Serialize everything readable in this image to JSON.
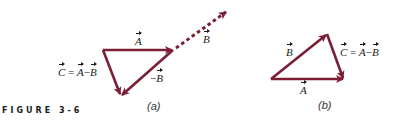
{
  "figure": {
    "label": "FIGURE 3-6"
  },
  "colors": {
    "vector": "#7a1f35",
    "text": "#1a1a1a"
  },
  "panel_a": {
    "sublabel": "(a)",
    "vector_A": {
      "name": "A",
      "from": [
        103,
        50
      ],
      "to": [
        173,
        50
      ]
    },
    "vector_negB": {
      "name": "−B",
      "from": [
        173,
        50
      ],
      "to": [
        121,
        96
      ]
    },
    "vector_C": {
      "name": "C",
      "from": [
        103,
        50
      ],
      "to": [
        121,
        96
      ]
    },
    "vector_B_dotted": {
      "name": "B",
      "from": [
        173,
        50
      ],
      "to": [
        228,
        10
      ]
    },
    "label_A": "A",
    "label_B": "B",
    "label_negB_sign": "−",
    "label_negB": "B",
    "label_C_eq": {
      "C": "C",
      "eq": " = ",
      "A": "A",
      "minus": "−",
      "B": "B"
    }
  },
  "panel_b": {
    "sublabel": "(b)",
    "vector_A": {
      "name": "A",
      "from": [
        271,
        79
      ],
      "to": [
        344,
        79
      ]
    },
    "vector_B": {
      "name": "B",
      "from": [
        271,
        79
      ],
      "to": [
        327,
        34
      ]
    },
    "vector_C": {
      "name": "C",
      "from": [
        327,
        34
      ],
      "to": [
        344,
        79
      ]
    },
    "label_A": "A",
    "label_B": "B",
    "label_C_eq": {
      "C": "C",
      "eq": " = ",
      "A": "A",
      "minus": "−",
      "B": "B"
    }
  }
}
